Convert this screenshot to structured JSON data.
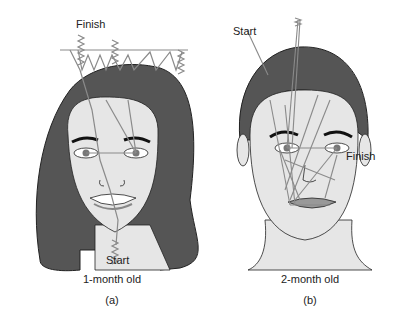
{
  "panel_a": {
    "face": "infant-female-face",
    "start_label": "Start",
    "finish_label": "Finish",
    "caption": "1-month old",
    "letter": "(a)"
  },
  "panel_b": {
    "face": "infant-male-face",
    "start_label": "Start",
    "finish_label": "Finish",
    "caption": "2-month old",
    "letter": "(b)"
  },
  "colors": {
    "hair": "#555555",
    "skin": "#e6e6e6",
    "scan_path": "#8a8a8a",
    "outline": "#222222"
  }
}
